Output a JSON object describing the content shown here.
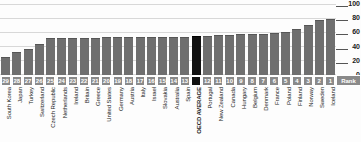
{
  "chart_data": {
    "type": "bar",
    "title": "",
    "subtitle": "",
    "xlabel": "",
    "ylabel": "",
    "ylim": [
      0,
      100
    ],
    "yticks": [
      100,
      80,
      60,
      40,
      20,
      0
    ],
    "grid": true,
    "legend": null,
    "rank_axis_label": "Rank",
    "highlight_color": "#111111",
    "bar_color": "#6f6f6f",
    "highlight_category": "OECD AVERAGE",
    "categories": [
      "South Korea",
      "Japan",
      "Turkey",
      "Switzerland",
      "Czech Republic",
      "Netherlands",
      "Ireland",
      "Britain",
      "Greece",
      "United States",
      "Germany",
      "Austria",
      "Italy",
      "Israel",
      "Slovakia",
      "Australia",
      "Spain",
      "OECD AVERAGE",
      "Portugal",
      "New Zealand",
      "Canada",
      "Hungary",
      "Belgium",
      "Denmark",
      "France",
      "Poland",
      "Finland",
      "Norway",
      "Sweden",
      "Iceland"
    ],
    "ranks": [
      "29",
      "28",
      "27",
      "26",
      "25",
      "24",
      "23",
      "22",
      "21",
      "20",
      "19",
      "18",
      "17",
      "16",
      "15",
      "14",
      "13",
      "",
      "12",
      "11",
      "10",
      "9",
      "8",
      "7",
      "6",
      "5",
      "4",
      "3",
      "2",
      "1"
    ],
    "values": [
      26,
      32,
      36,
      44,
      52,
      52,
      52,
      52,
      52,
      53,
      53,
      53,
      53,
      53,
      54,
      54,
      54,
      55,
      55,
      56,
      57,
      58,
      58,
      58,
      59,
      61,
      65,
      70,
      77,
      79
    ]
  }
}
